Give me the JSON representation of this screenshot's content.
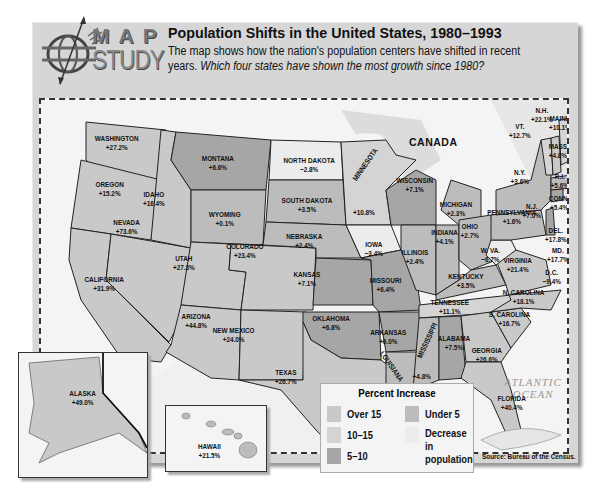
{
  "header": {
    "logo_top": "MAP",
    "logo_bottom": "STUDY",
    "title": "Population Shifts in the United States, 1980–1993",
    "description_plain": "The map shows how the nation's population centers have shifted in recent years.",
    "description_question": "Which four states have shown the most growth since 1980?"
  },
  "map": {
    "labels": {
      "canada": "CANADA",
      "mexico": "MEXICO",
      "pacific": "PACIFIC OCEAN",
      "atlantic": "ATLANTIC OCEAN",
      "gulf": "Gulf of Mexico"
    },
    "colors": {
      "over15": "#c9c9c9",
      "10to15": "#d4d4d4",
      "5to10": "#a6a6a6",
      "under5": "#bcbcbc",
      "decrease": "#ececec",
      "water": "#f4f4f4",
      "border": "#222222"
    },
    "states": [
      {
        "name": "WASHINGTON",
        "value": "+27.2%"
      },
      {
        "name": "OREGON",
        "value": "+15.2%"
      },
      {
        "name": "CALIFORNIA",
        "value": "+31.9%"
      },
      {
        "name": "NEVADA",
        "value": "+73.6%"
      },
      {
        "name": "IDAHO",
        "value": "+16.4%"
      },
      {
        "name": "MONTANA",
        "value": "+6.6%"
      },
      {
        "name": "WYOMING",
        "value": "+0.1%"
      },
      {
        "name": "UTAH",
        "value": "+27.3%"
      },
      {
        "name": "ARIZONA",
        "value": "+44.8%"
      },
      {
        "name": "COLORADO",
        "value": "+23.4%"
      },
      {
        "name": "NEW MEXICO",
        "value": "+24.0%"
      },
      {
        "name": "NORTH DAKOTA",
        "value": "−2.8%"
      },
      {
        "name": "SOUTH DAKOTA",
        "value": "+3.5%"
      },
      {
        "name": "NEBRASKA",
        "value": "+2.4%"
      },
      {
        "name": "KANSAS",
        "value": "+7.1%"
      },
      {
        "name": "OKLAHOMA",
        "value": "+6.8%"
      },
      {
        "name": "TEXAS",
        "value": "+26.7%"
      },
      {
        "name": "MINNESOTA",
        "value": "+10.8%"
      },
      {
        "name": "IOWA",
        "value": "−3.4%"
      },
      {
        "name": "MISSOURI",
        "value": "+6.4%"
      },
      {
        "name": "ARKANSAS",
        "value": "+6.0%"
      },
      {
        "name": "LOUISIANA",
        "value": "+2.1%"
      },
      {
        "name": "WISCONSIN",
        "value": "+7.1%"
      },
      {
        "name": "ILLINOIS",
        "value": "+2.4%"
      },
      {
        "name": "MICHIGAN",
        "value": "+2.3%"
      },
      {
        "name": "INDIANA",
        "value": "+4.1%"
      },
      {
        "name": "OHIO",
        "value": "+2.7%"
      },
      {
        "name": "KENTUCKY",
        "value": "+3.5%"
      },
      {
        "name": "TENNESSEE",
        "value": "+11.1%"
      },
      {
        "name": "MISSISSIPPI",
        "value": "+4.8%"
      },
      {
        "name": "ALABAMA",
        "value": "+7.5%"
      },
      {
        "name": "GEORGIA",
        "value": "+26.6%"
      },
      {
        "name": "FLORIDA",
        "value": "+40.4%"
      },
      {
        "name": "S. CAROLINA",
        "value": "+16.7%"
      },
      {
        "name": "N. CAROLINA",
        "value": "+18.1%"
      },
      {
        "name": "VIRGINIA",
        "value": "+21.4%"
      },
      {
        "name": "W. VA.",
        "value": "−6.7%"
      },
      {
        "name": "PENNSYLVANIA",
        "value": "+1.6%"
      },
      {
        "name": "N.Y.",
        "value": "+3.6%"
      },
      {
        "name": "VT.",
        "value": "+12.7%"
      },
      {
        "name": "N.H.",
        "value": "+22.1%"
      },
      {
        "name": "MAINE",
        "value": "+10.1%"
      },
      {
        "name": "MASS",
        "value": "+4.8%"
      },
      {
        "name": "R.I.",
        "value": "+5.6%"
      },
      {
        "name": "CONN.",
        "value": "+5.4%"
      },
      {
        "name": "N.J.",
        "value": "+7.0%"
      },
      {
        "name": "DEL.",
        "value": "+17.8%"
      },
      {
        "name": "MD.",
        "value": "+17.7%"
      },
      {
        "name": "D.C.",
        "value": "−9.4%"
      },
      {
        "name": "ALASKA",
        "value": "+49.0%"
      },
      {
        "name": "HAWAII",
        "value": "+21.5%"
      }
    ]
  },
  "legend": {
    "title": "Percent Increase",
    "items": [
      {
        "label": "Over 15",
        "color": "#c9c9c9"
      },
      {
        "label": "10–15",
        "color": "#d4d4d4"
      },
      {
        "label": "5–10",
        "color": "#a6a6a6"
      },
      {
        "label": "Under 5",
        "color": "#bcbcbc"
      },
      {
        "label": "Decrease in population",
        "color": "#ececec"
      }
    ]
  },
  "source": "Source: Bureau of the Census."
}
